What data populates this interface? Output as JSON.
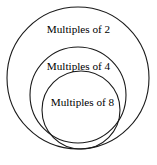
{
  "diagram": {
    "type": "nested-set-diagram",
    "background_color": "#ffffff",
    "stroke_color": "#1a1a1a",
    "text_color": "#000000",
    "sets": [
      {
        "id": "multiples-of-2",
        "label": "Multiples of 2",
        "level": 1,
        "shape": "circle",
        "center_x": 78,
        "center_y": 78,
        "radius": 71
      },
      {
        "id": "multiples-of-4",
        "label": "Multiples of 4",
        "level": 2,
        "shape": "circle",
        "center_x": 78,
        "center_y": 95,
        "radius": 48
      },
      {
        "id": "multiples-of-8",
        "label": "Multiples of 8",
        "level": 3,
        "shape": "circle",
        "center_x": 81,
        "center_y": 110,
        "radius": 39
      }
    ]
  }
}
